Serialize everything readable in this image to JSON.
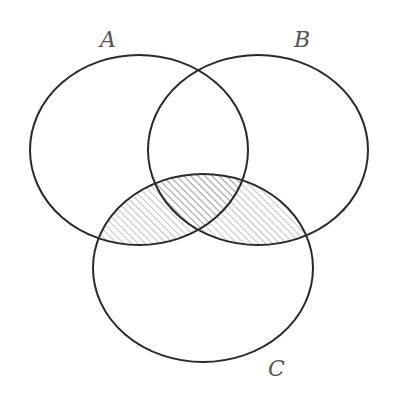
{
  "diagram": {
    "type": "venn",
    "sets": [
      {
        "id": "A",
        "label": "A"
      },
      {
        "id": "B",
        "label": "B"
      },
      {
        "id": "C",
        "label": "C"
      }
    ],
    "shaded_region": "(A ∪ B) ∩ C",
    "shading_style": "diagonal-hatch",
    "colors": {
      "outline": "#2a2a2a",
      "hatch": "#8a8a8a",
      "label": "#555555",
      "background": "#ffffff"
    }
  }
}
